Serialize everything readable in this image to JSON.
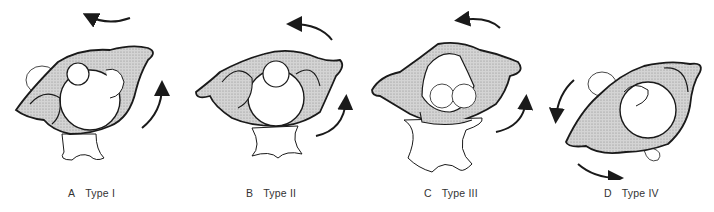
{
  "figure": {
    "panels": [
      {
        "letter": "A",
        "label": "Type I",
        "arrows": "counterclockwise-top, counterclockwise-right"
      },
      {
        "letter": "B",
        "label": "Type II",
        "arrows": "counterclockwise-top, counterclockwise-right"
      },
      {
        "letter": "C",
        "label": "Type III",
        "arrows": "counterclockwise-top, counterclockwise-right"
      },
      {
        "letter": "D",
        "label": "Type IV",
        "arrows": "counterclockwise-left, counterclockwise-bottom"
      }
    ],
    "colors": {
      "outline": "#1a1a1a",
      "shading": "#c8c8c8",
      "background": "#ffffff",
      "text": "#333333"
    }
  }
}
